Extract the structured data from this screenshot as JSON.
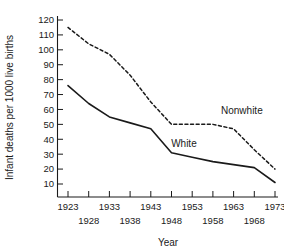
{
  "chart_data": {
    "type": "line",
    "title": "",
    "xlabel": "Year",
    "ylabel": "Infant deaths per 1000 live births",
    "x": [
      1923,
      1928,
      1933,
      1938,
      1943,
      1948,
      1953,
      1958,
      1963,
      1968,
      1973
    ],
    "xticklabels_top": [
      "1923",
      "1933",
      "1943",
      "1953",
      "1963",
      "1973"
    ],
    "xticklabels_bottom": [
      "1928",
      "1938",
      "1948",
      "1958",
      "1968"
    ],
    "yticklabels": [
      "120",
      "110",
      "100",
      "90",
      "80",
      "70",
      "60",
      "50",
      "40",
      "30",
      "20",
      "10"
    ],
    "ylim": [
      0,
      125
    ],
    "xlim": [
      1921,
      1975
    ],
    "grid": false,
    "legend_position": "inline-annotation",
    "series": [
      {
        "name": "Nonwhite",
        "style": "dashed",
        "color": "#1a1a1a",
        "values": [
          115,
          104,
          97,
          83,
          65,
          50,
          50,
          50,
          47,
          33,
          20
        ]
      },
      {
        "name": "White",
        "style": "solid",
        "color": "#1a1a1a",
        "values": [
          76,
          64,
          55,
          51,
          47,
          31,
          28,
          25,
          23,
          21,
          11
        ]
      }
    ],
    "annotations": [
      {
        "text": "Nonwhite",
        "x": 1965,
        "y": 57
      },
      {
        "text": "White",
        "x": 1951,
        "y": 35
      }
    ]
  }
}
